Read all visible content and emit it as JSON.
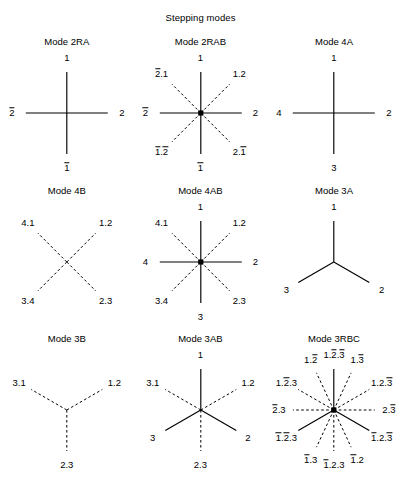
{
  "figure": {
    "title": "Stepping modes",
    "width": 401,
    "height": 478,
    "background": "#ffffff",
    "line_color": "#000000"
  },
  "chart_data": {
    "type": "diagram",
    "title": "Stepping modes",
    "layout": {
      "rows": 3,
      "cols": 3,
      "grid": "3x3"
    },
    "panels": [
      {
        "id": "2RA",
        "title": "Mode 2RA",
        "rays": [
          {
            "label": "1",
            "angle_deg": 90,
            "style": "solid"
          },
          {
            "label": "2",
            "angle_deg": 0,
            "style": "solid"
          },
          {
            "label": "1̅",
            "angle_deg": 270,
            "style": "solid"
          },
          {
            "label": "2̅",
            "angle_deg": 180,
            "style": "solid"
          }
        ],
        "hub": false
      },
      {
        "id": "2RAB",
        "title": "Mode 2RAB",
        "rays": [
          {
            "label": "1",
            "angle_deg": 90,
            "style": "solid"
          },
          {
            "label": "2",
            "angle_deg": 0,
            "style": "solid"
          },
          {
            "label": "1̅",
            "angle_deg": 270,
            "style": "solid"
          },
          {
            "label": "2̅",
            "angle_deg": 180,
            "style": "solid"
          },
          {
            "label": "1.2",
            "angle_deg": 45,
            "style": "dashed"
          },
          {
            "label": "2̅.1",
            "angle_deg": 135,
            "style": "dashed"
          },
          {
            "label": "1̅.2̅",
            "angle_deg": 225,
            "style": "dashed"
          },
          {
            "label": "2.1̅",
            "angle_deg": 315,
            "style": "dashed"
          }
        ],
        "hub": true
      },
      {
        "id": "4A",
        "title": "Mode 4A",
        "rays": [
          {
            "label": "1",
            "angle_deg": 90,
            "style": "solid"
          },
          {
            "label": "2",
            "angle_deg": 0,
            "style": "solid"
          },
          {
            "label": "3",
            "angle_deg": 270,
            "style": "solid"
          },
          {
            "label": "4",
            "angle_deg": 180,
            "style": "solid"
          }
        ],
        "hub": false
      },
      {
        "id": "4B",
        "title": "Mode 4B",
        "rays": [
          {
            "label": "1.2",
            "angle_deg": 45,
            "style": "dashed"
          },
          {
            "label": "4.1",
            "angle_deg": 135,
            "style": "dashed"
          },
          {
            "label": "3.4",
            "angle_deg": 225,
            "style": "dashed"
          },
          {
            "label": "2.3",
            "angle_deg": 315,
            "style": "dashed"
          }
        ],
        "hub": false
      },
      {
        "id": "4AB",
        "title": "Mode 4AB",
        "rays": [
          {
            "label": "1",
            "angle_deg": 90,
            "style": "solid"
          },
          {
            "label": "2",
            "angle_deg": 0,
            "style": "solid"
          },
          {
            "label": "3",
            "angle_deg": 270,
            "style": "solid"
          },
          {
            "label": "4",
            "angle_deg": 180,
            "style": "solid"
          },
          {
            "label": "1.2",
            "angle_deg": 45,
            "style": "dashed"
          },
          {
            "label": "4.1",
            "angle_deg": 135,
            "style": "dashed"
          },
          {
            "label": "3.4",
            "angle_deg": 225,
            "style": "dashed"
          },
          {
            "label": "2.3",
            "angle_deg": 315,
            "style": "dashed"
          }
        ],
        "hub": true
      },
      {
        "id": "3A",
        "title": "Mode 3A",
        "rays": [
          {
            "label": "1",
            "angle_deg": 90,
            "style": "solid"
          },
          {
            "label": "2",
            "angle_deg": 330,
            "style": "solid"
          },
          {
            "label": "3",
            "angle_deg": 210,
            "style": "solid"
          }
        ],
        "hub": false
      },
      {
        "id": "3B",
        "title": "Mode 3B",
        "rays": [
          {
            "label": "1.2",
            "angle_deg": 30,
            "style": "dashed"
          },
          {
            "label": "3.1",
            "angle_deg": 150,
            "style": "dashed"
          },
          {
            "label": "2.3",
            "angle_deg": 270,
            "style": "dashed"
          }
        ],
        "hub": false
      },
      {
        "id": "3AB",
        "title": "Mode 3AB",
        "rays": [
          {
            "label": "1",
            "angle_deg": 90,
            "style": "solid"
          },
          {
            "label": "2",
            "angle_deg": 330,
            "style": "solid"
          },
          {
            "label": "3",
            "angle_deg": 210,
            "style": "solid"
          },
          {
            "label": "1.2",
            "angle_deg": 30,
            "style": "dashed"
          },
          {
            "label": "3.1",
            "angle_deg": 150,
            "style": "dashed"
          },
          {
            "label": "2.3",
            "angle_deg": 270,
            "style": "dashed"
          }
        ],
        "hub": false
      },
      {
        "id": "3RBC",
        "title": "Mode 3RBC",
        "rays": [
          {
            "label": "1.2̅.3̅",
            "angle_deg": 90,
            "style": "solid"
          },
          {
            "label": "1̅.2̅.3",
            "angle_deg": 210,
            "style": "solid"
          },
          {
            "label": "1̅.2.3̅",
            "angle_deg": 330,
            "style": "solid"
          },
          {
            "label": "1.2̅",
            "angle_deg": 115,
            "style": "dashed"
          },
          {
            "label": "1.3̅",
            "angle_deg": 65,
            "style": "dashed"
          },
          {
            "label": "1.2̅.3",
            "angle_deg": 150,
            "style": "dashed"
          },
          {
            "label": "1.2.3̅",
            "angle_deg": 30,
            "style": "dashed"
          },
          {
            "label": "2̅.3",
            "angle_deg": 180,
            "style": "dashed"
          },
          {
            "label": "2.3̅",
            "angle_deg": 0,
            "style": "dashed"
          },
          {
            "label": "1̅.3",
            "angle_deg": 245,
            "style": "dashed"
          },
          {
            "label": "1̅.2",
            "angle_deg": 295,
            "style": "dashed"
          },
          {
            "label": "1̅.2.3",
            "angle_deg": 270,
            "style": "dashed"
          }
        ],
        "hub": true
      }
    ]
  }
}
